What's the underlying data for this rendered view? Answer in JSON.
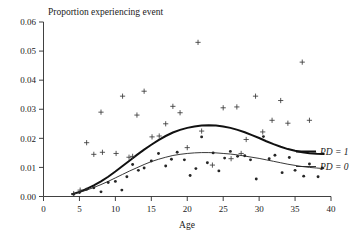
{
  "chart_data": {
    "type": "scatter",
    "title": "Proportion experiencing event",
    "xlabel": "Age",
    "ylabel": "",
    "xlim": [
      0,
      40
    ],
    "ylim": [
      0,
      0.06
    ],
    "grid": false,
    "legend_position": "right-inside",
    "xticks": [
      0,
      5,
      10,
      15,
      20,
      25,
      30,
      35,
      40
    ],
    "xtick_labels": [
      "0",
      "5",
      "10",
      "15",
      "20",
      "25",
      "30",
      "35",
      "40"
    ],
    "yticks": [
      0,
      0.01,
      0.02,
      0.03,
      0.04,
      0.05,
      0.06
    ],
    "ytick_labels": [
      "0.00",
      "0.01",
      "0.02",
      "0.03",
      "0.04",
      "0.05",
      "0.06"
    ],
    "legend": [
      {
        "label": "PD = 1",
        "marker": "plus",
        "line": "thick"
      },
      {
        "label": "PD = 0",
        "marker": "dot",
        "line": "thin"
      }
    ],
    "series": [
      {
        "name": "PD = 1",
        "marker": "plus",
        "line_style": "thick",
        "points": [
          {
            "x": 4.2,
            "y": 0.001
          },
          {
            "x": 5.1,
            "y": 0.0022
          },
          {
            "x": 6.0,
            "y": 0.0185
          },
          {
            "x": 7.0,
            "y": 0.0145
          },
          {
            "x": 8.0,
            "y": 0.029
          },
          {
            "x": 8.2,
            "y": 0.0152
          },
          {
            "x": 10.1,
            "y": 0.0148
          },
          {
            "x": 11.0,
            "y": 0.0345
          },
          {
            "x": 11.9,
            "y": 0.0135
          },
          {
            "x": 12.4,
            "y": 0.0138
          },
          {
            "x": 13.0,
            "y": 0.028
          },
          {
            "x": 14.0,
            "y": 0.0362
          },
          {
            "x": 15.1,
            "y": 0.0205
          },
          {
            "x": 16.1,
            "y": 0.0208
          },
          {
            "x": 17.0,
            "y": 0.025
          },
          {
            "x": 18.0,
            "y": 0.031
          },
          {
            "x": 19.0,
            "y": 0.0288
          },
          {
            "x": 20.0,
            "y": 0.0168
          },
          {
            "x": 21.5,
            "y": 0.053
          },
          {
            "x": 22.0,
            "y": 0.0225
          },
          {
            "x": 23.5,
            "y": 0.0108
          },
          {
            "x": 25.0,
            "y": 0.0305
          },
          {
            "x": 26.1,
            "y": 0.013
          },
          {
            "x": 26.9,
            "y": 0.0308
          },
          {
            "x": 27.5,
            "y": 0.0148
          },
          {
            "x": 28.2,
            "y": 0.0196
          },
          {
            "x": 29.5,
            "y": 0.0345
          },
          {
            "x": 30.5,
            "y": 0.0222
          },
          {
            "x": 31.8,
            "y": 0.0262
          },
          {
            "x": 33.0,
            "y": 0.033
          },
          {
            "x": 34.0,
            "y": 0.0252
          },
          {
            "x": 36.0,
            "y": 0.0462
          },
          {
            "x": 37.0,
            "y": 0.0262
          }
        ],
        "curve": [
          {
            "x": 4.0,
            "y": 0.0008
          },
          {
            "x": 5.0,
            "y": 0.0016
          },
          {
            "x": 6.0,
            "y": 0.0026
          },
          {
            "x": 7.0,
            "y": 0.0038
          },
          {
            "x": 8.0,
            "y": 0.0052
          },
          {
            "x": 9.0,
            "y": 0.0068
          },
          {
            "x": 10.0,
            "y": 0.0086
          },
          {
            "x": 11.0,
            "y": 0.0105
          },
          {
            "x": 12.0,
            "y": 0.0124
          },
          {
            "x": 13.0,
            "y": 0.0143
          },
          {
            "x": 14.0,
            "y": 0.0161
          },
          {
            "x": 15.0,
            "y": 0.0178
          },
          {
            "x": 16.0,
            "y": 0.0194
          },
          {
            "x": 17.0,
            "y": 0.0208
          },
          {
            "x": 18.0,
            "y": 0.022
          },
          {
            "x": 19.0,
            "y": 0.0229
          },
          {
            "x": 20.0,
            "y": 0.0236
          },
          {
            "x": 21.0,
            "y": 0.0241
          },
          {
            "x": 22.0,
            "y": 0.0244
          },
          {
            "x": 23.0,
            "y": 0.0245
          },
          {
            "x": 24.0,
            "y": 0.0244
          },
          {
            "x": 25.0,
            "y": 0.0241
          },
          {
            "x": 26.0,
            "y": 0.0236
          },
          {
            "x": 27.0,
            "y": 0.0229
          },
          {
            "x": 28.0,
            "y": 0.0221
          },
          {
            "x": 29.0,
            "y": 0.0211
          },
          {
            "x": 30.0,
            "y": 0.0201
          },
          {
            "x": 31.0,
            "y": 0.019
          },
          {
            "x": 32.0,
            "y": 0.018
          },
          {
            "x": 33.0,
            "y": 0.0171
          },
          {
            "x": 34.0,
            "y": 0.0163
          },
          {
            "x": 35.0,
            "y": 0.0157
          },
          {
            "x": 36.0,
            "y": 0.0152
          },
          {
            "x": 37.0,
            "y": 0.0149
          },
          {
            "x": 38.0,
            "y": 0.0147
          },
          {
            "x": 39.0,
            "y": 0.0146
          }
        ]
      },
      {
        "name": "PD = 0",
        "marker": "dot",
        "line_style": "thin",
        "points": [
          {
            "x": 4.2,
            "y": 0.0008
          },
          {
            "x": 5.0,
            "y": 0.0014
          },
          {
            "x": 6.0,
            "y": 0.0025
          },
          {
            "x": 7.0,
            "y": 0.003
          },
          {
            "x": 8.0,
            "y": 0.0016
          },
          {
            "x": 9.0,
            "y": 0.0048
          },
          {
            "x": 10.0,
            "y": 0.0052
          },
          {
            "x": 10.9,
            "y": 0.0022
          },
          {
            "x": 11.6,
            "y": 0.0068
          },
          {
            "x": 12.4,
            "y": 0.011
          },
          {
            "x": 13.2,
            "y": 0.009
          },
          {
            "x": 14.0,
            "y": 0.0098
          },
          {
            "x": 15.0,
            "y": 0.0122
          },
          {
            "x": 16.0,
            "y": 0.0148
          },
          {
            "x": 17.0,
            "y": 0.0105
          },
          {
            "x": 17.8,
            "y": 0.0128
          },
          {
            "x": 18.6,
            "y": 0.0152
          },
          {
            "x": 19.6,
            "y": 0.0126
          },
          {
            "x": 20.4,
            "y": 0.0072
          },
          {
            "x": 21.2,
            "y": 0.0096
          },
          {
            "x": 22.0,
            "y": 0.0205
          },
          {
            "x": 22.8,
            "y": 0.0116
          },
          {
            "x": 23.6,
            "y": 0.015
          },
          {
            "x": 24.4,
            "y": 0.0088
          },
          {
            "x": 25.2,
            "y": 0.0132
          },
          {
            "x": 26.0,
            "y": 0.0155
          },
          {
            "x": 27.0,
            "y": 0.0138
          },
          {
            "x": 28.0,
            "y": 0.014
          },
          {
            "x": 28.8,
            "y": 0.0126
          },
          {
            "x": 29.6,
            "y": 0.006
          },
          {
            "x": 30.6,
            "y": 0.0206
          },
          {
            "x": 31.4,
            "y": 0.013
          },
          {
            "x": 32.2,
            "y": 0.0142
          },
          {
            "x": 33.2,
            "y": 0.0082
          },
          {
            "x": 34.2,
            "y": 0.0134
          },
          {
            "x": 35.0,
            "y": 0.009
          },
          {
            "x": 36.2,
            "y": 0.007
          },
          {
            "x": 37.0,
            "y": 0.0112
          },
          {
            "x": 38.2,
            "y": 0.0068
          },
          {
            "x": 38.8,
            "y": 0.0098
          }
        ],
        "curve": [
          {
            "x": 4.0,
            "y": 0.0007
          },
          {
            "x": 5.0,
            "y": 0.0014
          },
          {
            "x": 6.0,
            "y": 0.0022
          },
          {
            "x": 7.0,
            "y": 0.0031
          },
          {
            "x": 8.0,
            "y": 0.0041
          },
          {
            "x": 9.0,
            "y": 0.0052
          },
          {
            "x": 10.0,
            "y": 0.0064
          },
          {
            "x": 11.0,
            "y": 0.0076
          },
          {
            "x": 12.0,
            "y": 0.0088
          },
          {
            "x": 13.0,
            "y": 0.0099
          },
          {
            "x": 14.0,
            "y": 0.011
          },
          {
            "x": 15.0,
            "y": 0.012
          },
          {
            "x": 16.0,
            "y": 0.0128
          },
          {
            "x": 17.0,
            "y": 0.0135
          },
          {
            "x": 18.0,
            "y": 0.0141
          },
          {
            "x": 19.0,
            "y": 0.0145
          },
          {
            "x": 20.0,
            "y": 0.0148
          },
          {
            "x": 21.0,
            "y": 0.015
          },
          {
            "x": 22.0,
            "y": 0.0151
          },
          {
            "x": 23.0,
            "y": 0.0151
          },
          {
            "x": 24.0,
            "y": 0.015
          },
          {
            "x": 25.0,
            "y": 0.0148
          },
          {
            "x": 26.0,
            "y": 0.0146
          },
          {
            "x": 27.0,
            "y": 0.0143
          },
          {
            "x": 28.0,
            "y": 0.0139
          },
          {
            "x": 29.0,
            "y": 0.0135
          },
          {
            "x": 30.0,
            "y": 0.0131
          },
          {
            "x": 31.0,
            "y": 0.0126
          },
          {
            "x": 32.0,
            "y": 0.0121
          },
          {
            "x": 33.0,
            "y": 0.0116
          },
          {
            "x": 34.0,
            "y": 0.0111
          },
          {
            "x": 35.0,
            "y": 0.0107
          },
          {
            "x": 36.0,
            "y": 0.0103
          },
          {
            "x": 37.0,
            "y": 0.01
          },
          {
            "x": 38.0,
            "y": 0.0098
          },
          {
            "x": 39.0,
            "y": 0.0096
          }
        ]
      }
    ]
  },
  "colors": {
    "axis": "#2b2b2b",
    "curve_thick": "#111111",
    "curve_thin": "#222222",
    "marker_plus": "#3a3a3a",
    "marker_dot": "#262626",
    "background": "#ffffff"
  }
}
